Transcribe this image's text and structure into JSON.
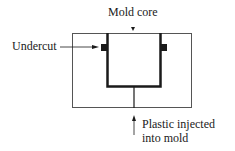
{
  "diagram": {
    "labels": {
      "mold_core": "Mold core",
      "undercut": "Undercut",
      "plastic_line1": "Plastic injected",
      "plastic_line2": "into mold"
    },
    "colors": {
      "stroke": "#1a1a1a",
      "outer_box": "#555555",
      "background": "#ffffff"
    }
  }
}
